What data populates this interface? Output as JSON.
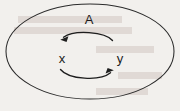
{
  "figure": {
    "background_color": "#f2f0ed",
    "ink_color": "#1e1e1e",
    "width": 180,
    "height": 111,
    "set_label": "A",
    "elements": [
      {
        "name": "x",
        "label": "x",
        "x": 62,
        "y": 62
      },
      {
        "name": "y",
        "label": "y",
        "x": 120,
        "y": 62
      }
    ],
    "arrows": [
      {
        "name": "arrow-y-to-x",
        "direction": "left",
        "from": "y",
        "to": "x",
        "position": "above"
      },
      {
        "name": "arrow-x-to-y",
        "direction": "right",
        "from": "x",
        "to": "y",
        "position": "below"
      }
    ]
  }
}
